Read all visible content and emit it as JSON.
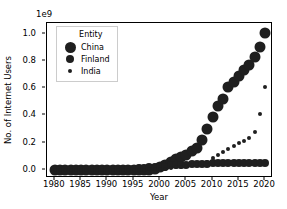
{
  "chart_data": {
    "type": "scatter",
    "title": "",
    "xlabel": "Year",
    "ylabel": "No. of Internet Users",
    "y_offset_text": "1e9",
    "xlim": [
      1978.5,
      2021.5
    ],
    "ylim": [
      -60000000.0,
      1080000000.0
    ],
    "xticks": [
      1980,
      1985,
      1990,
      1995,
      2000,
      2005,
      2010,
      2015,
      2020
    ],
    "xticklabels": [
      "1980",
      "1985",
      "1990",
      "1995",
      "2000",
      "2005",
      "2010",
      "2015",
      "2020"
    ],
    "yticks": [
      0.0,
      0.2,
      0.4,
      0.6,
      0.8,
      1.0
    ],
    "yticklabels": [
      "0.0",
      "0.2",
      "0.4",
      "0.6",
      "0.8",
      "1.0"
    ],
    "grid": false,
    "size_encoding": "marker size encodes Entity",
    "marker_color": "#1f1f1f",
    "legend": {
      "title": "Entity",
      "position": "upper left",
      "entries": [
        {
          "label": "China",
          "marker_px": 11
        },
        {
          "label": "Finland",
          "marker_px": 8
        },
        {
          "label": "India",
          "marker_px": 4
        }
      ]
    },
    "x": [
      1980,
      1981,
      1982,
      1983,
      1984,
      1985,
      1986,
      1987,
      1988,
      1989,
      1990,
      1991,
      1992,
      1993,
      1994,
      1995,
      1996,
      1997,
      1998,
      1999,
      2000,
      2001,
      2002,
      2003,
      2004,
      2005,
      2006,
      2007,
      2008,
      2009,
      2010,
      2011,
      2012,
      2013,
      2014,
      2015,
      2016,
      2017,
      2018,
      2019,
      2020
    ],
    "series": [
      {
        "name": "China",
        "marker_px": 11,
        "values": [
          0,
          0,
          0,
          0,
          0,
          0,
          0,
          0,
          0,
          0,
          0,
          0,
          0,
          0,
          0,
          200000.0,
          500000.0,
          1200000.0,
          2500000.0,
          8900000.0,
          22500000.0,
          33500000.0,
          59000000.0,
          79500000.0,
          94000000.0,
          111000000.0,
          138000000.0,
          162000000.0,
          218000000.0,
          304000000.0,
          389000000.0,
          470000000.0,
          524000000.0,
          606000000.0,
          649000000.0,
          688000000.0,
          731000000.0,
          772000000.0,
          829000000.0,
          904000000.0,
          1010000000.0
        ]
      },
      {
        "name": "Finland",
        "marker_px": 8,
        "values": [
          0,
          0,
          0,
          0,
          0,
          0,
          0,
          0,
          50000.0,
          100000.0,
          200000.0,
          400000.0,
          800000.0,
          1500000.0,
          2900000.0,
          7000000.0,
          10000000.0,
          14000000.0,
          18000000.0,
          21000000.0,
          19000000.0,
          22000000.0,
          32000000.0,
          34000000.0,
          38000000.0,
          39000000.0,
          41000000.0,
          43000000.0,
          45000000.0,
          46000000.0,
          47000000.0,
          48000000.0,
          49000000.0,
          50000000.0,
          50000000.0,
          50000000.0,
          50000000.0,
          50000000.0,
          50000000.0,
          51000000.0,
          52000000.0
        ]
      },
      {
        "name": "India",
        "marker_px": 4,
        "values": [
          0,
          0,
          0,
          0,
          0,
          0,
          0,
          0,
          0,
          0,
          0,
          0,
          0,
          0,
          0,
          250000.0,
          600000.0,
          1300000.0,
          2600000.0,
          2800000.0,
          5500000.0,
          7000000.0,
          16000000.0,
          19000000.0,
          22000000.0,
          27000000.0,
          35000000.0,
          45000000.0,
          52000000.0,
          57000000.0,
          88000000.0,
          107000000.0,
          128000000.0,
          153000000.0,
          173000000.0,
          195000000.0,
          210000000.0,
          237000000.0,
          280000000.0,
          410000000.0,
          608000000.0
        ]
      }
    ]
  }
}
